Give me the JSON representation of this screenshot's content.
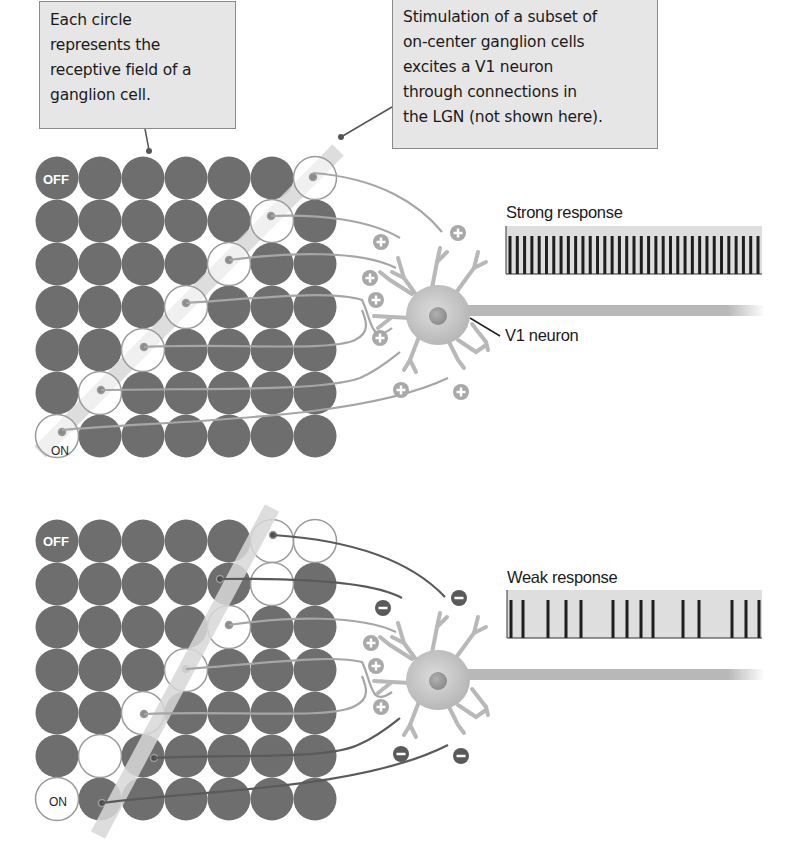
{
  "callouts": {
    "left": {
      "lines": [
        "Each circle",
        "represents the",
        "receptive field of a",
        "ganglion cell."
      ]
    },
    "right": {
      "lines": [
        "Stimulation of a subset of",
        "on-center ganglion cells",
        "excites a V1 neuron",
        "through connections in",
        "the LGN (not shown here)."
      ]
    }
  },
  "labels": {
    "off": "OFF",
    "on": "ON",
    "v1_neuron": "V1 neuron",
    "strong_response": "Strong response",
    "weak_response": "Weak response"
  },
  "colors": {
    "filled_cell": "#6e6e6e",
    "open_cell_stroke": "#9a9a9a",
    "bar": "#d9d9d9",
    "excitatory_synapse": "#a8a8a8",
    "inhibitory_synapse": "#5a5a5a",
    "neuron": "#bdbdbd",
    "callout_bg": "#e6e6e6",
    "spike_box": "#dedede",
    "spike": "#1f1f1f"
  },
  "panels": [
    {
      "id": "top",
      "description": "Bar aligned with open (on-center) receptive fields",
      "open_cells": [
        [
          0,
          6
        ],
        [
          1,
          5
        ],
        [
          2,
          4
        ],
        [
          3,
          3
        ],
        [
          4,
          2
        ],
        [
          5,
          1
        ],
        [
          6,
          0
        ]
      ],
      "synapses": [
        "+",
        "+",
        "+",
        "+",
        "+",
        "+",
        "+",
        "+"
      ],
      "response": "strong",
      "spike_count": 35
    },
    {
      "id": "bottom",
      "description": "Bar at a steeper orientation crosses filled (off) regions",
      "open_cells": [
        [
          0,
          5
        ],
        [
          0,
          6
        ],
        [
          1,
          5
        ],
        [
          2,
          4
        ],
        [
          3,
          3
        ],
        [
          4,
          2
        ],
        [
          5,
          1
        ],
        [
          6,
          0
        ]
      ],
      "synapses": [
        "-",
        "-",
        "+",
        "+",
        "+",
        "-",
        "-"
      ],
      "response": "weak",
      "spike_count": 14
    }
  ]
}
